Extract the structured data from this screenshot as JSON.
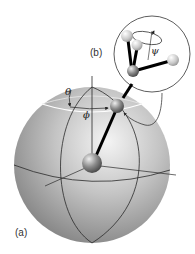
{
  "figure": {
    "panel_a_label": "(a)",
    "panel_b_label": "(b)",
    "angles": {
      "theta": "θ",
      "phi": "ϕ",
      "psi": "ψ"
    }
  },
  "colors": {
    "sphere_light": "#f2f2f2",
    "sphere_mid": "#b8b8b8",
    "sphere_dark": "#7a7a7a",
    "line": "#2a2a2a",
    "ball_dark": "#555555",
    "ball_light": "#e6e6e6"
  }
}
